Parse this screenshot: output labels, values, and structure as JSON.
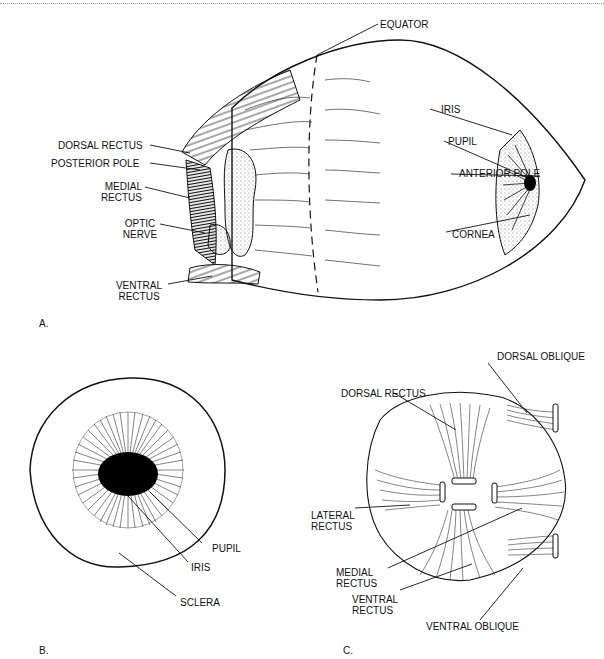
{
  "figure_a": {
    "panel_label": "A.",
    "labels": {
      "equator": "EQUATOR",
      "iris": "IRIS",
      "pupil": "PUPIL",
      "anterior_pole": "ANTERIOR POLE",
      "cornea": "CORNEA",
      "dorsal_rectus": "DORSAL RECTUS",
      "posterior_pole": "POSTERIOR POLE",
      "medial_rectus_1": "MEDIAL",
      "medial_rectus_2": "RECTUS",
      "optic_nerve_1": "OPTIC",
      "optic_nerve_2": "NERVE",
      "ventral_rectus_1": "VENTRAL",
      "ventral_rectus_2": "RECTUS"
    }
  },
  "figure_b": {
    "panel_label": "B.",
    "labels": {
      "pupil": "PUPIL",
      "iris": "IRIS",
      "sclera": "SCLERA"
    }
  },
  "figure_c": {
    "panel_label": "C.",
    "labels": {
      "dorsal_oblique": "DORSAL OBLIQUE",
      "dorsal_rectus": "DORSAL RECTUS",
      "lateral_rectus_1": "LATERAL",
      "lateral_rectus_2": "RECTUS",
      "medial_rectus_1": "MEDIAL",
      "medial_rectus_2": "RECTUS",
      "ventral_rectus_1": "VENTRAL",
      "ventral_rectus_2": "RECTUS",
      "ventral_oblique": "VENTRAL OBLIQUE"
    }
  }
}
